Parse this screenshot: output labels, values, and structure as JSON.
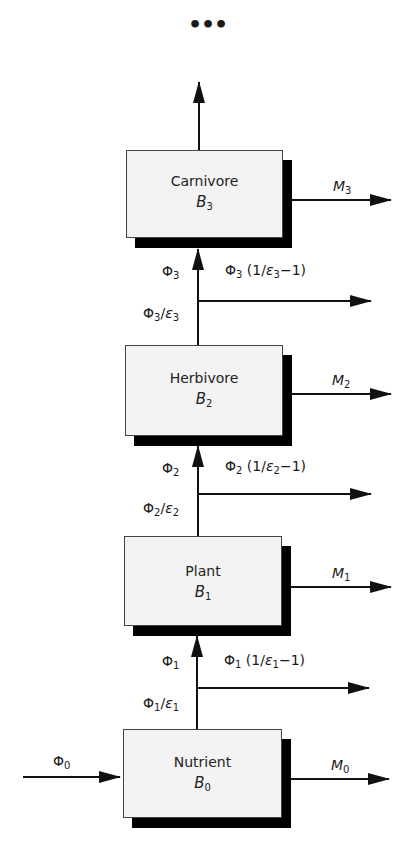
{
  "diagram": {
    "continuation": "•••",
    "colors": {
      "box_fill": "#f3f3f3",
      "shadow": "#000000",
      "line": "#111111"
    },
    "levels": [
      {
        "id": 3,
        "name": "Carnivore",
        "symbol": "B",
        "index": "3",
        "loss_label": {
          "sym": "M",
          "idx": "3"
        }
      },
      {
        "id": 2,
        "name": "Herbivore",
        "symbol": "B",
        "index": "2",
        "loss_label": {
          "sym": "M",
          "idx": "2"
        }
      },
      {
        "id": 1,
        "name": "Plant",
        "symbol": "B",
        "index": "1",
        "loss_label": {
          "sym": "M",
          "idx": "1"
        }
      },
      {
        "id": 0,
        "name": "Nutrient",
        "symbol": "B",
        "index": "0",
        "loss_label": {
          "sym": "M",
          "idx": "0"
        }
      }
    ],
    "transfers": [
      {
        "to_level": 3,
        "flow": {
          "phi": "Φ",
          "idx": "3"
        },
        "intake": {
          "phi": "Φ",
          "idx": "3",
          "eps": "ε",
          "eps_idx": "3"
        },
        "waste": {
          "phi": "Φ",
          "idx": "3",
          "open": "(1/",
          "eps": "ε",
          "eps_idx": "3",
          "close": "−1)"
        }
      },
      {
        "to_level": 2,
        "flow": {
          "phi": "Φ",
          "idx": "2"
        },
        "intake": {
          "phi": "Φ",
          "idx": "2",
          "eps": "ε",
          "eps_idx": "2"
        },
        "waste": {
          "phi": "Φ",
          "idx": "2",
          "open": "(1/",
          "eps": "ε",
          "eps_idx": "2",
          "close": "−1)"
        }
      },
      {
        "to_level": 1,
        "flow": {
          "phi": "Φ",
          "idx": "1"
        },
        "intake": {
          "phi": "Φ",
          "idx": "1",
          "eps": "ε",
          "eps_idx": "1"
        },
        "waste": {
          "phi": "Φ",
          "idx": "1",
          "open": "(1/",
          "eps": "ε",
          "eps_idx": "1",
          "close": "−1)"
        }
      }
    ],
    "input": {
      "phi": "Φ",
      "idx": "0"
    }
  }
}
